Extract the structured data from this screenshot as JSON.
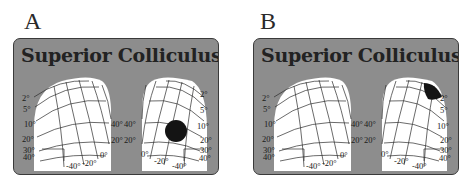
{
  "figure": {
    "panels": [
      {
        "label": "A",
        "title": "Superior Colliculus",
        "left_map": {
          "eccentricity_labels": [
            "2°",
            "5°",
            "10°",
            "20°",
            "30°",
            "40°"
          ],
          "polar_labels_bottom": [
            "-40°",
            "-20°",
            "0°"
          ],
          "polar_labels_side": [
            "40°",
            "20°"
          ]
        },
        "right_map": {
          "eccentricity_labels": [
            "2°",
            "5°",
            "10°",
            "20°",
            "30°",
            "40°"
          ],
          "polar_labels_bottom": [
            "0°",
            "-20°",
            "-40°"
          ],
          "polar_labels_side": [
            "40°",
            "20°"
          ],
          "activity_marker": "large circular activation at mid eccentricity (~10°)"
        }
      },
      {
        "label": "B",
        "title": "Superior Colliculus",
        "left_map": {
          "eccentricity_labels": [
            "2°",
            "5°",
            "10°",
            "20°",
            "30°",
            "40°"
          ],
          "polar_labels_bottom": [
            "-40°",
            "-20°",
            "0°"
          ],
          "polar_labels_side": [
            "40°",
            "20°"
          ]
        },
        "right_map": {
          "eccentricity_labels": [
            "2°",
            "5°",
            "10°",
            "20°",
            "30°",
            "40°"
          ],
          "polar_labels_bottom": [
            "0°",
            "-20°",
            "-40°"
          ],
          "polar_labels_side": [
            "40°",
            "20°"
          ],
          "activity_marker": "crescent activation near fovea (~2°)"
        }
      }
    ],
    "colors": {
      "panel_bg": "#8d8d8d",
      "map_fill": "#ffffff",
      "grid_line": "#2b2b2b",
      "activation": "#141414"
    }
  }
}
